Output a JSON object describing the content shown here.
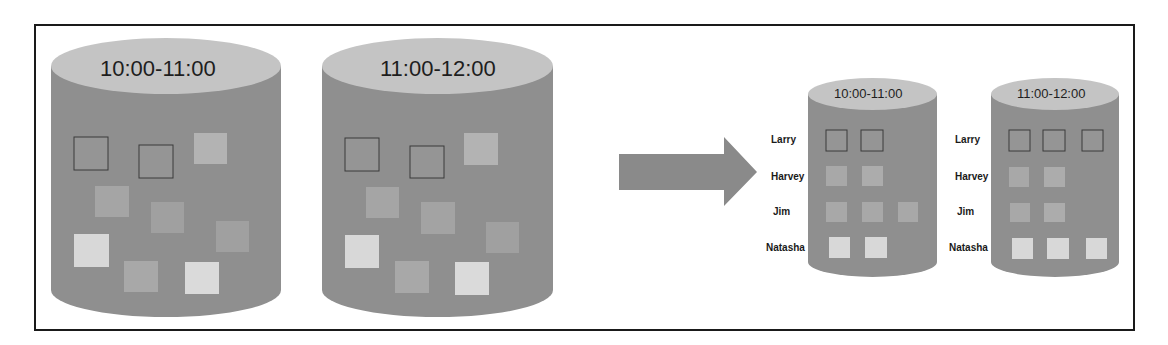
{
  "diagram": {
    "colors": {
      "frame": "#1a1a1a",
      "cylinder_body": "#8f8f8f",
      "cylinder_top": "#c4c4c4",
      "arrow": "#8a8a8a",
      "square_dark": "#8a8a8a",
      "square_mid": "#a3a3a3",
      "square_light": "#d6d6d6",
      "square_border": "#333333"
    },
    "before": {
      "cylinders": [
        {
          "label": "10:00-11:00"
        },
        {
          "label": "11:00-12:00"
        }
      ]
    },
    "transition": {
      "arrow": "right-arrow"
    },
    "after": {
      "row_labels": [
        "Larry",
        "Harvey",
        "Jim",
        "Natasha"
      ],
      "cylinders": [
        {
          "label": "10:00-11:00",
          "rows": {
            "Larry": 2,
            "Harvey": 2,
            "Jim": 3,
            "Natasha": 2
          }
        },
        {
          "label": "11:00-12:00",
          "rows": {
            "Larry": 3,
            "Harvey": 2,
            "Jim": 2,
            "Natasha": 3
          }
        }
      ]
    }
  }
}
